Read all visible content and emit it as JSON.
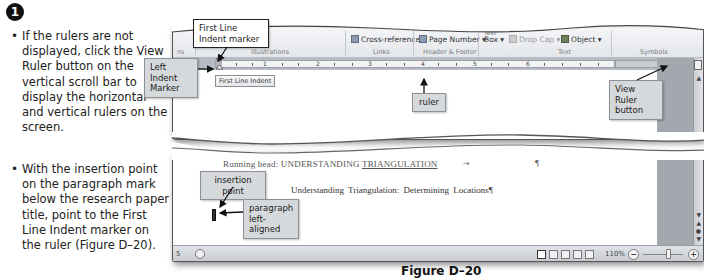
{
  "step": {
    "number": "1",
    "bullets": [
      "If the rulers are not displayed, click the View Ruler button on the vertical scroll bar to display the horizontal and vertical rulers on the screen.",
      "With the insertion point on the paragraph mark below the research paper title, point to the First Line Indent marker on the ruler (Figure D–20)."
    ]
  },
  "ribbon": {
    "commands": {
      "cross_reference": "Cross-reference",
      "page_number": "Page Number ▾",
      "text_box": "Box ▾",
      "text_box_top": "Text",
      "drop_cap": "Drop Cap ▾",
      "object": "Object ▾"
    },
    "groups": {
      "illustrations": "Illustrations",
      "links": "Links",
      "header_footer": "Header & Footer",
      "text": "Text",
      "symbols": "Symbols"
    }
  },
  "ruler": {
    "numbers": [
      "1",
      "2",
      "3",
      "4",
      "5",
      "6"
    ],
    "tooltip": "First Line Indent"
  },
  "document": {
    "running_head_prefix": "Running head: UNDERSTANDING ",
    "running_head_underlined": "TRIANGULATION",
    "tab_arrow": "→",
    "running_head_para_mark": "¶",
    "title_line": "Understanding Triangulation: Determining Locations¶"
  },
  "statusbar": {
    "page_indicator": "5",
    "zoom_level": "110%",
    "zoom_out": "−",
    "zoom_in": "+"
  },
  "callouts": {
    "first_line_indent": "First Line Indent marker",
    "left_indent": "Left Indent Marker",
    "ruler": "ruler",
    "view_ruler": "View Ruler button",
    "insertion_point": "insertion point",
    "paragraph_left_aligned": "paragraph left-aligned"
  },
  "figure_caption": "Figure D–20"
}
